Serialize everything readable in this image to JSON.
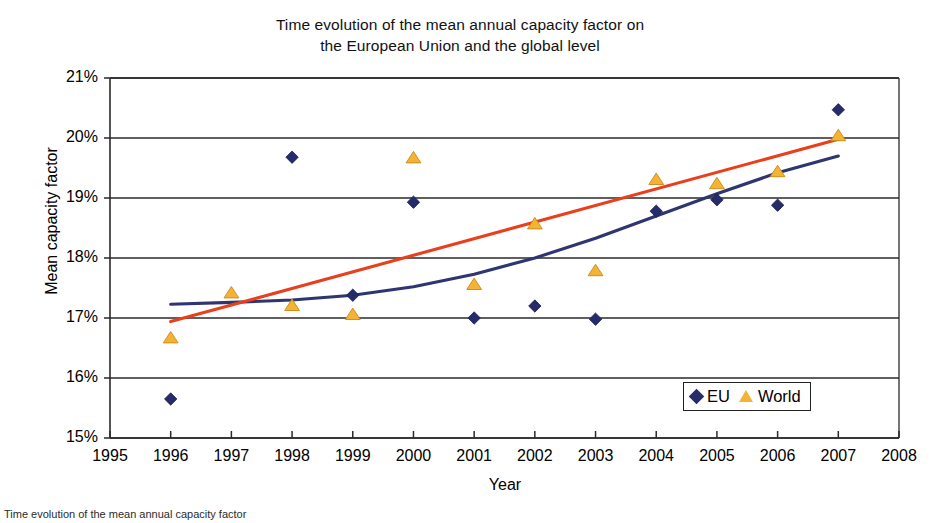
{
  "chart_data": {
    "type": "scatter",
    "title": "Time evolution of the mean annual capacity factor on the European Union and the global level",
    "title_line1": "Time evolution of the mean annual capacity factor on",
    "title_line2": "the European Union and the global level",
    "xlabel": "Year",
    "ylabel": "Mean capacity factor",
    "xlim": [
      1995,
      2008
    ],
    "ylim": [
      15,
      21
    ],
    "xticks": [
      "1995",
      "1996",
      "1997",
      "1998",
      "1999",
      "2000",
      "2001",
      "2002",
      "2003",
      "2004",
      "2005",
      "2006",
      "2007",
      "2008"
    ],
    "yticks": [
      "15%",
      "16%",
      "17%",
      "18%",
      "19%",
      "20%",
      "21%"
    ],
    "grid": "horizontal",
    "legend_position": "bottom-right",
    "x": [
      1996,
      1997,
      1998,
      1999,
      2000,
      2001,
      2002,
      2003,
      2004,
      2005,
      2006,
      2007
    ],
    "series": [
      {
        "name": "EU",
        "marker": "diamond",
        "color": "#262B6B",
        "values": [
          15.65,
          null,
          19.68,
          17.38,
          18.93,
          17.0,
          17.2,
          16.98,
          18.78,
          18.97,
          18.88,
          20.47
        ],
        "trend": {
          "type": "polynomial",
          "color": "#2E3570",
          "points": [
            [
              1996.0,
              17.23
            ],
            [
              1997.0,
              17.26
            ],
            [
              1998.0,
              17.3
            ],
            [
              1999.0,
              17.38
            ],
            [
              2000.0,
              17.52
            ],
            [
              2001.0,
              17.73
            ],
            [
              2002.0,
              18.0
            ],
            [
              2003.0,
              18.33
            ],
            [
              2004.0,
              18.7
            ],
            [
              2005.0,
              19.07
            ],
            [
              2006.0,
              19.42
            ],
            [
              2007.0,
              19.7
            ]
          ]
        }
      },
      {
        "name": "World",
        "marker": "triangle",
        "color": "#F5B335",
        "values": [
          16.68,
          17.43,
          17.22,
          17.07,
          19.68,
          17.57,
          18.58,
          17.8,
          19.32,
          19.25,
          19.45,
          20.05
        ],
        "trend": {
          "type": "linear",
          "color": "#E8401C",
          "points": [
            [
              1996.0,
              16.94
            ],
            [
              2007.0,
              19.98
            ]
          ]
        }
      }
    ],
    "points": [
      {
        "year": 1996,
        "eu": 15.65,
        "world": 16.68
      },
      {
        "year": 1997,
        "eu": null,
        "world": 17.43
      },
      {
        "year": 1998,
        "eu": 19.68,
        "world": 17.22
      },
      {
        "year": 1999,
        "eu": 17.38,
        "world": 17.07
      },
      {
        "year": 2000,
        "eu": 18.93,
        "world": 19.68
      },
      {
        "year": 2001,
        "eu": 17.0,
        "world": 17.57
      },
      {
        "year": 2002,
        "eu": 17.2,
        "world": 18.58
      },
      {
        "year": 2003,
        "eu": 16.98,
        "world": 17.8
      },
      {
        "year": 2004,
        "eu": 18.78,
        "world": 19.32
      },
      {
        "year": 2005,
        "eu": 18.97,
        "world": 19.25
      },
      {
        "year": 2006,
        "eu": 18.88,
        "world": 19.45
      },
      {
        "year": 2007,
        "eu": 20.47,
        "world": 20.05
      }
    ]
  },
  "legend": {
    "eu_label": "EU",
    "world_label": "World",
    "eu_color": "#262B6B",
    "world_color": "#F5B335"
  },
  "caption": {
    "text": "Time evolution of the mean annual capacity factor"
  }
}
